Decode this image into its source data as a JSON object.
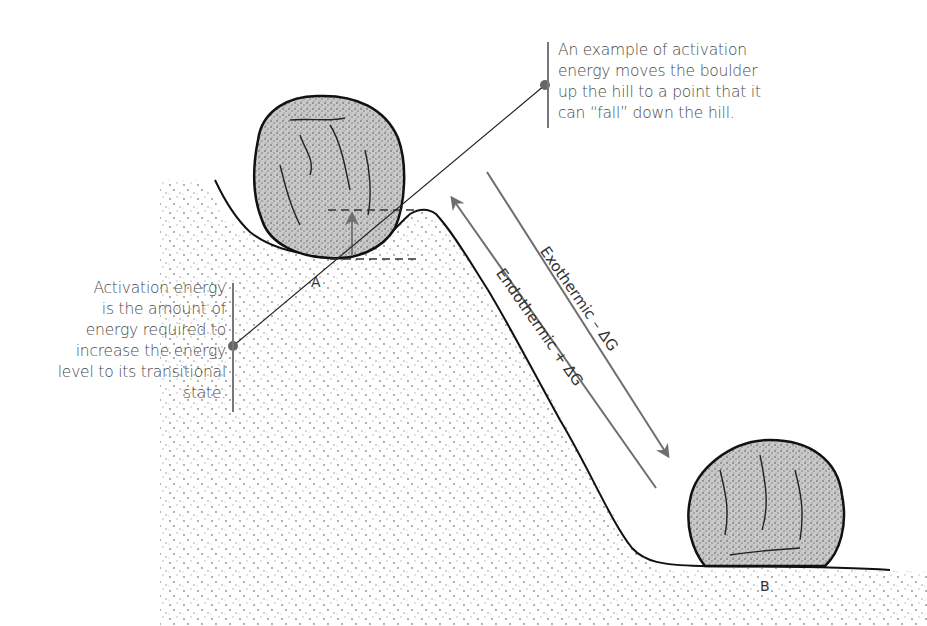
{
  "figure": {
    "callouts": {
      "top": {
        "lines": [
          "An example of activation",
          "energy moves the boulder",
          "up the hill to a point that it",
          "can “fall” down the hill."
        ]
      },
      "left": {
        "lines": [
          "Activation energy",
          "is the amount of",
          "energy required to",
          "increase the energy",
          "level to its transitional",
          "state."
        ]
      }
    },
    "points": {
      "a": "A",
      "b": "B"
    },
    "arrows": {
      "exothermic": "Exothermic – ΔG",
      "endothermic": "Endothermic + ΔG"
    },
    "colors": {
      "outline": "#111111",
      "boulder_fill": "#c8c8c8",
      "arrow": "#6e6e6e",
      "text": "#4a4a4a",
      "dot_marker": "#666666"
    }
  }
}
